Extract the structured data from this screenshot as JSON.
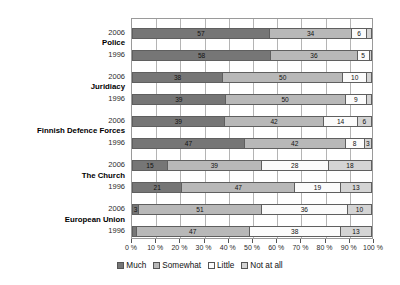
{
  "chart_data": {
    "type": "bar",
    "orientation": "horizontal",
    "stacked": true,
    "title": "",
    "subtitle": "",
    "xlabel": "",
    "ylabel": "",
    "xlim": [
      0,
      100
    ],
    "grid": true,
    "legend_position": "bottom",
    "x_tick_labels": [
      "0 %",
      "10 %",
      "20 %",
      "30 %",
      "40 %",
      "50 %",
      "60 %",
      "70 %",
      "80 %",
      "90 %",
      "100 %"
    ],
    "x_tick_values": [
      0,
      10,
      20,
      30,
      40,
      50,
      60,
      70,
      80,
      90,
      100
    ],
    "series": [
      {
        "name": "Much",
        "color": "#767676"
      },
      {
        "name": "Somewhat",
        "color": "#b8b8b8"
      },
      {
        "name": "Little",
        "color": "#fbfbfb"
      },
      {
        "name": "Not at all",
        "color": "#d4d4d4"
      }
    ],
    "groups": [
      {
        "name": "Police",
        "rows": [
          {
            "year": "2006",
            "values": [
              57,
              34,
              6,
              2
            ],
            "labels": [
              "57",
              "34",
              "6",
              "2"
            ]
          },
          {
            "year": "1996",
            "values": [
              58,
              36,
              5,
              1
            ],
            "labels": [
              "58",
              "36",
              "5",
              "1"
            ]
          }
        ]
      },
      {
        "name": "Juridiacy",
        "rows": [
          {
            "year": "2006",
            "values": [
              38,
              50,
              10,
              2
            ],
            "labels": [
              "38",
              "50",
              "10",
              "2"
            ]
          },
          {
            "year": "1996",
            "values": [
              39,
              50,
              9,
              2
            ],
            "labels": [
              "39",
              "50",
              "9",
              "2"
            ]
          }
        ]
      },
      {
        "name": "Finnish Defence Forces",
        "rows": [
          {
            "year": "2006",
            "values": [
              39,
              42,
              14,
              6
            ],
            "labels": [
              "39",
              "42",
              "14",
              "6"
            ]
          },
          {
            "year": "1996",
            "values": [
              47,
              42,
              8,
              3
            ],
            "labels": [
              "47",
              "42",
              "8",
              "3"
            ]
          }
        ]
      },
      {
        "name": "The Church",
        "rows": [
          {
            "year": "2006",
            "values": [
              15,
              39,
              28,
              18
            ],
            "labels": [
              "15",
              "39",
              "28",
              "18"
            ]
          },
          {
            "year": "1996",
            "values": [
              21,
              47,
              19,
              13
            ],
            "labels": [
              "21",
              "47",
              "19",
              "13"
            ]
          }
        ]
      },
      {
        "name": "European Union",
        "rows": [
          {
            "year": "2006",
            "values": [
              3,
              51,
              36,
              10
            ],
            "labels": [
              "3",
              "51",
              "36",
              "10"
            ]
          },
          {
            "year": "1996",
            "values": [
              2,
              47,
              38,
              13
            ],
            "labels": [
              "2",
              "47",
              "38",
              "13"
            ]
          }
        ]
      }
    ]
  },
  "legend": {
    "items": [
      {
        "label": "Much"
      },
      {
        "label": "Somewhat"
      },
      {
        "label": "Little"
      },
      {
        "label": "Not at all"
      }
    ]
  }
}
